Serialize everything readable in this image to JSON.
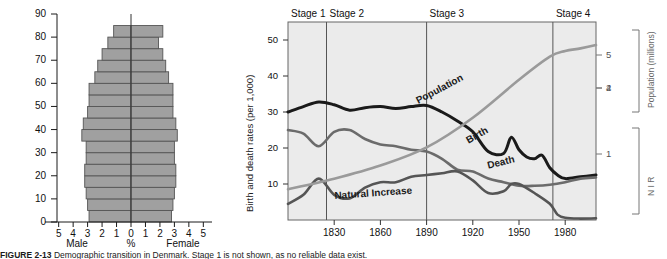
{
  "figure": {
    "caption_label": "FIGURE 2-13",
    "caption_text": "Demographic transition in Denmark. Stage 1 is not shown, as no reliable data exist."
  },
  "pyramid": {
    "title": "population-pyramid",
    "y_label": "",
    "y_ticks": [
      0,
      10,
      20,
      30,
      40,
      50,
      60,
      70,
      80,
      90
    ],
    "x_ticks": [
      "5",
      "4",
      "3",
      "2",
      "1",
      "0",
      "1",
      "2",
      "3",
      "4",
      "5"
    ],
    "x_axis_center_label": "%",
    "left_label": "Male",
    "right_label": "Female",
    "bar_color": "#a0a0a0",
    "bar_stroke": "#555555"
  },
  "chart_data": [
    {
      "type": "bar",
      "name": "population-pyramid",
      "orientation": "horizontal-pyramid",
      "title": "Population pyramid",
      "xlabel": "%",
      "ylabel": "Age",
      "xlim": [
        -5,
        5
      ],
      "ylim": [
        0,
        90
      ],
      "grid": false,
      "categories": [
        "0-4",
        "5-9",
        "10-14",
        "15-19",
        "20-24",
        "25-29",
        "30-34",
        "35-39",
        "40-44",
        "45-49",
        "50-54",
        "55-59",
        "60-64",
        "65-69",
        "70-74",
        "75-79",
        "80-84"
      ],
      "series": [
        {
          "name": "Male",
          "values": [
            2.9,
            3.0,
            3.1,
            3.2,
            3.2,
            3.1,
            3.1,
            3.4,
            3.3,
            3.0,
            2.9,
            2.9,
            2.5,
            2.3,
            2.0,
            1.6,
            1.2
          ]
        },
        {
          "name": "Female",
          "values": [
            2.8,
            2.9,
            3.0,
            3.1,
            3.1,
            3.0,
            3.0,
            3.2,
            3.1,
            2.9,
            2.9,
            2.9,
            2.6,
            2.4,
            2.2,
            1.9,
            2.2
          ]
        }
      ]
    },
    {
      "type": "line",
      "name": "demographic-transition-model",
      "title": "Demographic transition",
      "xlabel": "Year",
      "ylabel": "Birth and death rates (per 1,000)",
      "xlim": [
        1800,
        2000
      ],
      "ylim": [
        0,
        55
      ],
      "grid": false,
      "x_ticks": [
        1830,
        1860,
        1890,
        1920,
        1950,
        1980
      ],
      "y_ticks": [
        10,
        20,
        30,
        40,
        50
      ],
      "right_axis_population": {
        "label": "Population (millions)",
        "ticks": [
          4,
          5
        ],
        "range": [
          0,
          6
        ]
      },
      "right_axis_nir": {
        "label": "N I R",
        "ticks": [
          1,
          2
        ],
        "range": [
          0,
          3
        ]
      },
      "stages": [
        {
          "label": "Stage 1",
          "start": 1800,
          "end": 1825
        },
        {
          "label": "Stage 2",
          "start": 1825,
          "end": 1890
        },
        {
          "label": "Stage 3",
          "start": 1890,
          "end": 1972
        },
        {
          "label": "Stage 4",
          "start": 1972,
          "end": 2000
        }
      ],
      "series": [
        {
          "name": "Birth",
          "color": "#1a1a1a",
          "x": [
            1800,
            1810,
            1820,
            1830,
            1840,
            1850,
            1860,
            1870,
            1880,
            1890,
            1900,
            1910,
            1920,
            1930,
            1940,
            1945,
            1950,
            1955,
            1960,
            1965,
            1970,
            1975,
            1980,
            1990,
            2000
          ],
          "values": [
            30.0,
            31.5,
            32.8,
            32.0,
            30.5,
            31.2,
            31.5,
            31.0,
            31.5,
            31.8,
            30.0,
            27.5,
            24.5,
            19.0,
            18.5,
            23.0,
            19.5,
            17.5,
            17.0,
            18.0,
            14.5,
            12.5,
            11.5,
            12.0,
            12.5
          ]
        },
        {
          "name": "Death",
          "color": "#6b6b6b",
          "x": [
            1800,
            1810,
            1820,
            1830,
            1840,
            1850,
            1860,
            1870,
            1880,
            1890,
            1900,
            1910,
            1920,
            1930,
            1940,
            1950,
            1960,
            1970,
            1980,
            1990,
            2000
          ],
          "values": [
            25.0,
            24.0,
            20.5,
            24.5,
            25.0,
            22.5,
            21.0,
            20.5,
            19.5,
            19.0,
            17.0,
            14.0,
            13.5,
            11.5,
            10.5,
            9.5,
            9.5,
            9.8,
            10.5,
            11.5,
            11.8
          ]
        },
        {
          "name": "Natural Increase",
          "color": "#555555",
          "x": [
            1800,
            1810,
            1820,
            1830,
            1840,
            1850,
            1860,
            1870,
            1880,
            1890,
            1900,
            1910,
            1920,
            1930,
            1940,
            1945,
            1950,
            1960,
            1970,
            1975,
            1980,
            1990,
            2000
          ],
          "values": [
            4.5,
            7.0,
            11.5,
            7.0,
            6.0,
            9.0,
            10.5,
            10.5,
            12.0,
            12.5,
            13.0,
            13.5,
            11.0,
            7.5,
            8.0,
            10.0,
            10.0,
            7.5,
            4.5,
            1.5,
            0.6,
            0.4,
            0.5
          ]
        },
        {
          "name": "Population",
          "color": "#9a9a9a",
          "axis": "right-population",
          "x": [
            1800,
            1830,
            1860,
            1890,
            1920,
            1950,
            1970,
            1980,
            1990,
            2000
          ],
          "values": [
            0.93,
            1.25,
            1.65,
            2.2,
            3.1,
            4.25,
            4.95,
            5.12,
            5.2,
            5.3
          ]
        }
      ],
      "annotations": [
        "Population",
        "Birth",
        "Death",
        "Natural Increase"
      ]
    }
  ]
}
